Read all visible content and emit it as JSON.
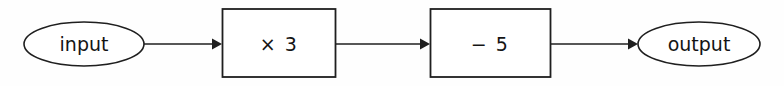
{
  "diagram": {
    "type": "function-machine-flowchart",
    "orientation": "left-to-right",
    "background_color": "#fefefe",
    "stroke_color": "#1f1f1f",
    "text_color": "#141414",
    "nodes": [
      {
        "id": "input",
        "shape": "ellipse",
        "label": "input",
        "role": "start"
      },
      {
        "id": "op1",
        "shape": "rectangle",
        "label": "× 3",
        "role": "operation"
      },
      {
        "id": "op2",
        "shape": "rectangle",
        "label": "− 5",
        "role": "operation"
      },
      {
        "id": "output",
        "shape": "ellipse",
        "label": "output",
        "role": "end"
      }
    ],
    "edges": [
      {
        "id": "edge-input-op1",
        "from": "input",
        "to": "op1",
        "label": "",
        "arrowhead": "filled-triangle"
      },
      {
        "id": "edge-op1-op2",
        "from": "op1",
        "to": "op2",
        "label": "",
        "arrowhead": "filled-triangle"
      },
      {
        "id": "edge-op2-output",
        "from": "op2",
        "to": "output",
        "label": "",
        "arrowhead": "filled-triangle"
      }
    ]
  }
}
